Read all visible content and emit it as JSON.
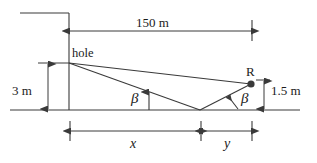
{
  "figure": {
    "type": "geometry-diagram",
    "stroke_color": "#3a3a3a",
    "text_color": "#1b1b1b",
    "background": "#ffffff"
  },
  "labels": {
    "total_span": "150 m",
    "hole": "hole",
    "wall_height": "3 m",
    "point_r": "R",
    "r_height": "1.5 m",
    "angle_left": "β",
    "angle_right": "β",
    "dim_x": "x",
    "dim_y": "y"
  },
  "geometry": {
    "ground_line_y": 110,
    "hole_point": {
      "x": 69,
      "y": 63
    },
    "reflection_point": {
      "x": 200,
      "y": 110
    },
    "r_point": {
      "x": 251,
      "y": 84
    },
    "wall_x": 69,
    "right_tick_x": 252,
    "horizontal_dimension_y": 31,
    "bottom_dimension_y": 131
  },
  "values": {
    "total_horizontal_distance_m": 150,
    "hole_height_m": 3,
    "receiver_height_m": 1.5,
    "segment_x_label": "x",
    "segment_y_label": "y",
    "angle_symbol": "beta"
  }
}
